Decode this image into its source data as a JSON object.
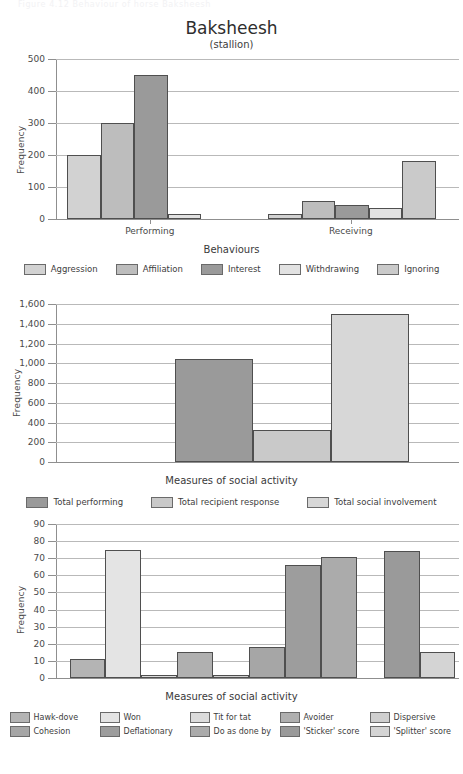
{
  "page": {
    "running_head": "Figure 4.12 Behaviour of horse Baksheesh"
  },
  "palette": {
    "c1": "#d2d2d2",
    "c2": "#bdbdbd",
    "c3": "#9a9a9a",
    "c4": "#e2e2e2",
    "c5": "#cacaca",
    "c6": "#a8a8a8",
    "c7": "#b4b4b4",
    "c8": "#8f8f8f",
    "c9": "#dcdcdc",
    "c10": "#d7d7d7",
    "axis": "#8f8f8f",
    "grid": "#b9b9b9",
    "text": "#3d3d3d"
  },
  "chart_data": [
    {
      "id": "chart1",
      "type": "bar",
      "title": "Baksheesh",
      "subtitle": "(stallion)",
      "xlabel": "Behaviours",
      "ylabel": "Frequency",
      "ylim": [
        0,
        500
      ],
      "yticks": [
        0,
        100,
        200,
        300,
        400,
        500
      ],
      "ytick_labels": [
        "0",
        "100",
        "200",
        "300",
        "400",
        "500"
      ],
      "grid": true,
      "legend_position": "bottom",
      "categories": [
        "Performing",
        "Receiving"
      ],
      "series": [
        {
          "name": "Aggression",
          "color": "#d2d2d2",
          "values": [
            200,
            15
          ]
        },
        {
          "name": "Affiliation",
          "color": "#bdbdbd",
          "values": [
            300,
            55
          ]
        },
        {
          "name": "Interest",
          "color": "#9a9a9a",
          "values": [
            450,
            45
          ]
        },
        {
          "name": "Withdrawing",
          "color": "#e2e2e2",
          "values": [
            15,
            35
          ]
        },
        {
          "name": "Ignoring",
          "color": "#cacaca",
          "values": [
            0,
            180
          ]
        }
      ]
    },
    {
      "id": "chart2",
      "type": "bar",
      "title": "",
      "subtitle": "",
      "xlabel": "Measures of social activity",
      "ylabel": "Frequency",
      "ylim": [
        0,
        1600
      ],
      "yticks": [
        0,
        200,
        400,
        600,
        800,
        1000,
        1200,
        1400,
        1600
      ],
      "ytick_labels": [
        "0",
        "200",
        "400",
        "600",
        "800",
        "1,000",
        "1,200",
        "1,400",
        "1,600"
      ],
      "grid": true,
      "legend_position": "bottom",
      "categories": [
        "Total performing",
        "Total recipient response",
        "Total social involvement"
      ],
      "values": [
        1040,
        320,
        1500
      ],
      "colors": [
        "#9a9a9a",
        "#c9c9c9",
        "#d7d7d7"
      ]
    },
    {
      "id": "chart3",
      "type": "bar",
      "title": "",
      "subtitle": "",
      "xlabel": "Measures of social activity",
      "ylabel": "Frequency",
      "ylim": [
        0,
        90
      ],
      "yticks": [
        0,
        10,
        20,
        30,
        40,
        50,
        60,
        70,
        80,
        90
      ],
      "ytick_labels": [
        "0",
        "10",
        "20",
        "30",
        "40",
        "50",
        "60",
        "70",
        "80",
        "90"
      ],
      "grid": true,
      "legend_position": "bottom",
      "categories": [
        "Hawk-dove",
        "Won",
        "Tit for tat",
        "Avoider",
        "Dispersive",
        "Cohesion",
        "Deflationary",
        "Do as done by",
        "'Sticker' score",
        "'Splitter' score"
      ],
      "values": [
        11,
        75,
        2,
        15,
        1.5,
        18,
        66,
        71,
        74,
        15
      ],
      "colors": [
        "#b4b4b4",
        "#e4e4e4",
        "#dcdcdc",
        "#b0b0b0",
        "#cfcfcf",
        "#a6a6a6",
        "#9d9d9d",
        "#ababab",
        "#9a9a9a",
        "#d4d4d4"
      ]
    }
  ],
  "fig1": {
    "title": "Baksheesh",
    "subtitle": "(stallion)",
    "ylabel": "Frequency",
    "xlabel": "Behaviours",
    "xcats": [
      "Performing",
      "Receiving"
    ],
    "yticks": [
      "500",
      "400",
      "300",
      "200",
      "100",
      "0"
    ],
    "legend": [
      "Aggression",
      "Affiliation",
      "Interest",
      "Withdrawing",
      "Ignoring"
    ]
  },
  "fig2": {
    "ylabel": "Frequency",
    "xlabel": "Measures of social activity",
    "yticks": [
      "1,600",
      "1,400",
      "1,200",
      "1,000",
      "800",
      "600",
      "400",
      "200",
      "0"
    ],
    "legend": [
      "Total performing",
      "Total recipient response",
      "Total social involvement"
    ]
  },
  "fig3": {
    "ylabel": "Frequency",
    "xlabel": "Measures of social activity",
    "yticks": [
      "90",
      "80",
      "70",
      "60",
      "50",
      "40",
      "30",
      "20",
      "10",
      "0"
    ],
    "legend_row1": [
      "Hawk-dove",
      "Won",
      "Tit for tat",
      "Avoider",
      "Dispersive"
    ],
    "legend_row2": [
      "Cohesion",
      "Deflationary",
      "Do as done by",
      "'Sticker' score",
      "'Splitter' score"
    ]
  }
}
